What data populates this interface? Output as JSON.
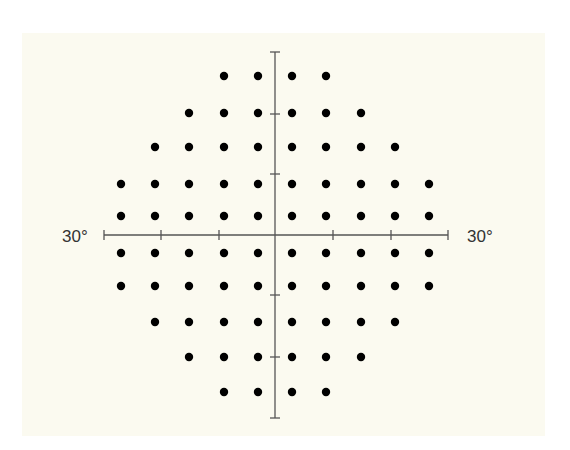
{
  "figure": {
    "panel_color": "#fbfaf0",
    "axis_color": "#555555",
    "dot_color": "#000000",
    "left_label": "30°",
    "right_label": "30°"
  },
  "axes": {
    "center": [
      275,
      235
    ],
    "horizontal": {
      "x1": 104,
      "x2": 448,
      "y": 235,
      "ticks_x": [
        104,
        161,
        219,
        333,
        391,
        448
      ]
    },
    "vertical": {
      "y1": 52,
      "y2": 418,
      "x": 275,
      "ticks_y": [
        52,
        114,
        174,
        295,
        357,
        418
      ]
    }
  },
  "grid": {
    "columns_x": [
      121,
      155,
      189,
      224,
      258,
      292,
      326,
      361,
      395,
      429
    ],
    "rows": [
      {
        "y": 76,
        "cols": [
          3,
          4,
          5,
          6
        ]
      },
      {
        "y": 113,
        "cols": [
          2,
          3,
          4,
          5,
          6,
          7
        ]
      },
      {
        "y": 147,
        "cols": [
          1,
          2,
          3,
          4,
          5,
          6,
          7,
          8
        ]
      },
      {
        "y": 184,
        "cols": [
          0,
          1,
          2,
          3,
          4,
          5,
          6,
          7,
          8,
          9
        ]
      },
      {
        "y": 216,
        "cols": [
          0,
          1,
          2,
          3,
          4,
          5,
          6,
          7,
          8,
          9
        ]
      },
      {
        "y": 253,
        "cols": [
          0,
          1,
          2,
          3,
          4,
          5,
          6,
          7,
          8,
          9
        ]
      },
      {
        "y": 286,
        "cols": [
          0,
          1,
          2,
          3,
          4,
          5,
          6,
          7,
          8,
          9
        ]
      },
      {
        "y": 322,
        "cols": [
          1,
          2,
          3,
          4,
          5,
          6,
          7,
          8
        ]
      },
      {
        "y": 357,
        "cols": [
          2,
          3,
          4,
          5,
          6,
          7
        ]
      },
      {
        "y": 392,
        "cols": [
          3,
          4,
          5,
          6
        ]
      }
    ],
    "dot_radius": 4.2,
    "total_points": 76
  }
}
